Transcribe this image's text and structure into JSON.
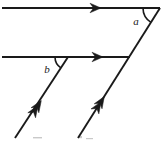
{
  "figure": {
    "canvas": {
      "width": 165,
      "height": 142,
      "background": "#ffffff"
    },
    "ink_color": "#1a1a1a",
    "labels": {
      "angle_a": "a",
      "angle_b": "b"
    },
    "label_positions": {
      "angle_a": {
        "x": 136,
        "y": 25
      },
      "angle_b": {
        "x": 47,
        "y": 73
      }
    },
    "lines": [
      {
        "name": "top-horizontal-line",
        "role": "parallel-line-1",
        "x1": 2,
        "y1": 8,
        "x2": 160,
        "y2": 8,
        "arrowheads": 1,
        "arrow_at": {
          "x": 98,
          "y": 8
        },
        "direction": "right"
      },
      {
        "name": "middle-horizontal-line",
        "role": "parallel-line-2",
        "x1": 2,
        "y1": 57,
        "x2": 130,
        "y2": 57,
        "arrowheads": 1,
        "arrow_at": {
          "x": 100,
          "y": 57
        },
        "direction": "right"
      },
      {
        "name": "right-diagonal-line",
        "role": "transversal-1",
        "x1": 160,
        "y1": 8,
        "x2": 78,
        "y2": 138,
        "arrowheads": 2,
        "arrow_at": {
          "x": 104,
          "y": 97
        },
        "direction": "up-right"
      },
      {
        "name": "left-diagonal-line",
        "role": "transversal-2",
        "x1": 68,
        "y1": 57,
        "x2": 15,
        "y2": 138,
        "arrowheads": 2,
        "arrow_at": {
          "x": 41,
          "y": 101
        },
        "direction": "up-right"
      }
    ],
    "angle_arcs": [
      {
        "name": "angle-arc-a",
        "vertex": {
          "x": 160,
          "y": 8
        },
        "radius": 17,
        "between": [
          "top-horizontal-line",
          "right-diagonal-line"
        ]
      },
      {
        "name": "angle-arc-b",
        "vertex": {
          "x": 68,
          "y": 57
        },
        "radius": 13,
        "between": [
          "middle-horizontal-line",
          "left-diagonal-line"
        ]
      }
    ]
  }
}
